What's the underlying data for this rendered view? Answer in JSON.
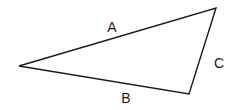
{
  "diagram": {
    "type": "triangle",
    "background": "#ffffff",
    "stroke_color": "#1a1a1a",
    "vertices": {
      "left": {
        "x": 19,
        "y": 66
      },
      "top_right": {
        "x": 216,
        "y": 8
      },
      "bottom": {
        "x": 189,
        "y": 94
      }
    },
    "sides": [
      {
        "id": "A",
        "label": "A",
        "from": "left",
        "to": "top_right",
        "label_pos": {
          "x": 112,
          "y": 32
        }
      },
      {
        "id": "B",
        "label": "B",
        "from": "left",
        "to": "bottom",
        "label_pos": {
          "x": 126,
          "y": 103
        }
      },
      {
        "id": "C",
        "label": "C",
        "from": "top_right",
        "to": "bottom",
        "label_pos": {
          "x": 219,
          "y": 68
        }
      }
    ]
  }
}
